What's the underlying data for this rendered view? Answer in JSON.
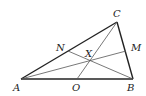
{
  "diagram": {
    "points": {
      "A": {
        "label": "A",
        "x": 21,
        "y": 79
      },
      "B": {
        "label": "B",
        "x": 133,
        "y": 79
      },
      "C": {
        "label": "C",
        "x": 117,
        "y": 22
      },
      "N": {
        "label": "N",
        "x": 68,
        "y": 51
      },
      "M": {
        "label": "M",
        "x": 126,
        "y": 51
      },
      "O": {
        "label": "O",
        "x": 77,
        "y": 79
      },
      "X": {
        "label": "X",
        "x": 90,
        "y": 59
      }
    },
    "sides": [
      "AB",
      "BC",
      "CA"
    ],
    "cevians": [
      "AM",
      "BN",
      "CO"
    ],
    "concurrency_point": "X"
  }
}
